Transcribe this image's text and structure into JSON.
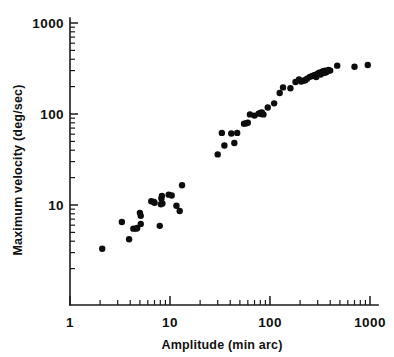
{
  "chart_data": {
    "type": "scatter",
    "title": "",
    "xlabel": "Amplitude (min arc)",
    "ylabel": "Maximum velocity (deg/sec)",
    "xscale": "log",
    "yscale": "log",
    "xlim": [
      1,
      1100
    ],
    "ylim": [
      2,
      1000
    ],
    "grid": false,
    "legend": null,
    "xticks": [
      1,
      10,
      100,
      1000
    ],
    "xticklabels": [
      "1",
      "10",
      "100",
      "1000"
    ],
    "yticks": [
      10,
      100,
      1000
    ],
    "yticklabels": [
      "10",
      "100",
      "1000"
    ],
    "minor_ticks": true,
    "marker": "filled-circle",
    "marker_color": "#0d0d0d",
    "marker_size_px": 4.2,
    "series": [
      {
        "name": "saccades",
        "points": [
          [
            2.1,
            3.3
          ],
          [
            3.3,
            6.5
          ],
          [
            3.9,
            4.2
          ],
          [
            4.3,
            5.5
          ],
          [
            4.6,
            5.5
          ],
          [
            4.7,
            5.6
          ],
          [
            5.1,
            6.2
          ],
          [
            5.0,
            8.2
          ],
          [
            5.1,
            7.6
          ],
          [
            6.5,
            11.0
          ],
          [
            6.9,
            10.8
          ],
          [
            7.0,
            10.6
          ],
          [
            7.9,
            5.9
          ],
          [
            8.1,
            10.2
          ],
          [
            8.2,
            11.8
          ],
          [
            8.3,
            12.6
          ],
          [
            8.4,
            10.4
          ],
          [
            9.7,
            13.0
          ],
          [
            10.4,
            12.7
          ],
          [
            11.6,
            9.8
          ],
          [
            12.5,
            8.6
          ],
          [
            13.2,
            16.5
          ],
          [
            30.0,
            36.0
          ],
          [
            33.0,
            62.0
          ],
          [
            35.0,
            45.0
          ],
          [
            41.0,
            61.0
          ],
          [
            44.0,
            48.0
          ],
          [
            47.0,
            62.0
          ],
          [
            55.0,
            78.0
          ],
          [
            58.0,
            79.0
          ],
          [
            60.0,
            80.0
          ],
          [
            63.0,
            99.0
          ],
          [
            70.0,
            96.0
          ],
          [
            77.0,
            101.0
          ],
          [
            80.0,
            103.0
          ],
          [
            82.0,
            100.0
          ],
          [
            83.0,
            104.0
          ],
          [
            86.0,
            99.0
          ],
          [
            95.0,
            118.0
          ],
          [
            110.0,
            131.0
          ],
          [
            125.0,
            170.0
          ],
          [
            135.0,
            196.0
          ],
          [
            160.0,
            192.0
          ],
          [
            180.0,
            225.0
          ],
          [
            195.0,
            240.0
          ],
          [
            205.0,
            228.0
          ],
          [
            215.0,
            232.0
          ],
          [
            225.0,
            235.0
          ],
          [
            235.0,
            244.0
          ],
          [
            250.0,
            256.0
          ],
          [
            265.0,
            262.0
          ],
          [
            280.0,
            268.0
          ],
          [
            290.0,
            255.0
          ],
          [
            300.0,
            278.0
          ],
          [
            310.0,
            285.0
          ],
          [
            320.0,
            272.0
          ],
          [
            330.0,
            290.0
          ],
          [
            340.0,
            295.0
          ],
          [
            345.0,
            282.0
          ],
          [
            355.0,
            300.0
          ],
          [
            365.0,
            288.0
          ],
          [
            375.0,
            296.0
          ],
          [
            385.0,
            305.0
          ],
          [
            400.0,
            300.0
          ],
          [
            470.0,
            340.0
          ],
          [
            700.0,
            330.0
          ],
          [
            950.0,
            345.0
          ]
        ]
      }
    ],
    "point_count": 67
  },
  "axes": {
    "x_axis_name": "amplitude-axis",
    "y_axis_name": "velocity-axis"
  }
}
